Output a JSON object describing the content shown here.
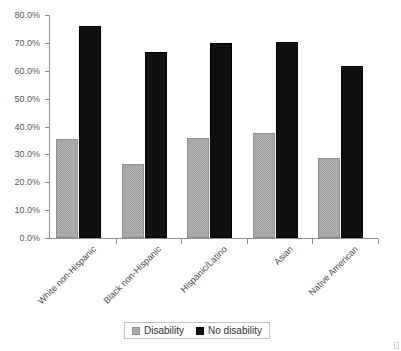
{
  "chart_data": {
    "type": "bar",
    "title": "",
    "subtitle": "",
    "xlabel": "",
    "ylabel": "",
    "categories": [
      "White non-Hispanic",
      "Black non-Hispanic",
      "Hispanic/Latino",
      "Asian",
      "Native American"
    ],
    "series": [
      {
        "name": "Disability",
        "color": "#a0a0a0",
        "values": [
          35.5,
          26.5,
          35.8,
          37.6,
          28.8
        ]
      },
      {
        "name": "No disability",
        "color": "#101010",
        "values": [
          76.0,
          66.8,
          69.8,
          70.2,
          61.6
        ]
      }
    ],
    "ylim": [
      0,
      80
    ],
    "ytick_values": [
      0,
      10,
      20,
      30,
      40,
      50,
      60,
      70,
      80
    ],
    "ytick_labels": [
      "0.0%",
      "10.0%",
      "20.0%",
      "30.0%",
      "40.0%",
      "50.0%",
      "60.0%",
      "70.0%",
      "80.0%"
    ],
    "grid": false,
    "legend_position": "bottom",
    "legend_entries": [
      "Disability",
      "No disability"
    ],
    "xtick_label_rotation": -45
  },
  "legend": {
    "items": [
      {
        "label": "Disability",
        "swatch": "gray-swatch-icon"
      },
      {
        "label": "No disability",
        "swatch": "black-swatch-icon"
      }
    ]
  }
}
